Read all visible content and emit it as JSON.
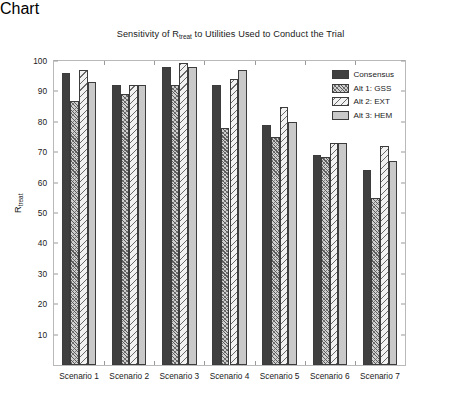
{
  "chart_data": {
    "type": "bar",
    "title_main_pre": "Sensitivity of R",
    "title_sub": "treat",
    "title_main_post": " to Utilities Used to Conduct the Trial",
    "xlabel": "",
    "ylabel": "R_treat",
    "ylabel_main": "R",
    "ylabel_sub": "treat",
    "ylim": [
      0,
      100
    ],
    "ytick_step": 10,
    "yticks": [
      10,
      20,
      30,
      40,
      50,
      60,
      70,
      80,
      90,
      100
    ],
    "grid": false,
    "legend_position": "top-right-inside",
    "categories": [
      "Scenario 1",
      "Scenario 2",
      "Scenario 3",
      "Scenario 4",
      "Scenario 5",
      "Scenario 6",
      "Scenario 7"
    ],
    "series": [
      {
        "name": "Consensus",
        "pattern": "solid-dark",
        "color": "#404040",
        "values": [
          96,
          92,
          98,
          92,
          79,
          69,
          64
        ]
      },
      {
        "name": "Alt 1: GSS",
        "pattern": "dense-crosshatch",
        "color": "#cfcfcf",
        "values": [
          87,
          89,
          92,
          78,
          75,
          68.5,
          55
        ]
      },
      {
        "name": "Alt 2: EXT",
        "pattern": "diagonal-stripe",
        "color": "#f2f2f2",
        "values": [
          97,
          92,
          99.5,
          94,
          85,
          73,
          72
        ]
      },
      {
        "name": "Alt 3: HEM",
        "pattern": "solid-light",
        "color": "#c9c9c9",
        "values": [
          93,
          92,
          98,
          97,
          80,
          73,
          67
        ]
      }
    ]
  },
  "legend": {
    "items": [
      {
        "label": "Consensus"
      },
      {
        "label": "Alt 1: GSS"
      },
      {
        "label": "Alt 2: EXT"
      },
      {
        "label": "Alt 3: HEM"
      }
    ]
  }
}
